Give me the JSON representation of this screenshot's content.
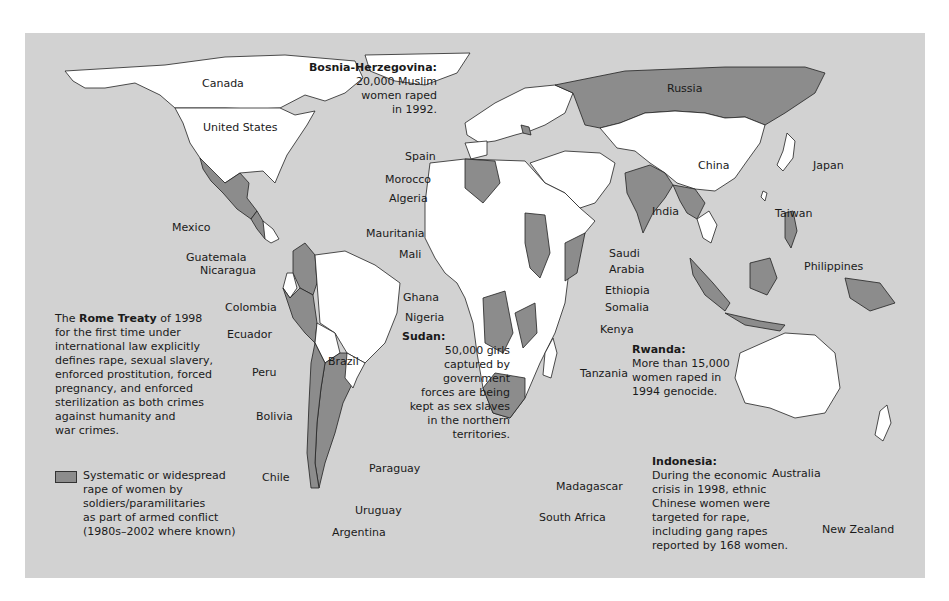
{
  "map": {
    "colors": {
      "ocean": "#d2d2d2",
      "land_default": "#ffffff",
      "land_affected": "#8c8c8c",
      "land_other": "#c9c9c9",
      "border": "#222222"
    },
    "country_labels": [
      {
        "id": "canada",
        "text": "Canada"
      },
      {
        "id": "united-states",
        "text": "United States"
      },
      {
        "id": "mexico",
        "text": "Mexico"
      },
      {
        "id": "guatemala",
        "text": "Guatemala"
      },
      {
        "id": "nicaragua",
        "text": "Nicaragua"
      },
      {
        "id": "colombia",
        "text": "Colombia"
      },
      {
        "id": "ecuador",
        "text": "Ecuador"
      },
      {
        "id": "peru",
        "text": "Peru"
      },
      {
        "id": "brazil",
        "text": "Brazil"
      },
      {
        "id": "bolivia",
        "text": "Bolivia"
      },
      {
        "id": "paraguay",
        "text": "Paraguay"
      },
      {
        "id": "chile",
        "text": "Chile"
      },
      {
        "id": "uruguay",
        "text": "Uruguay"
      },
      {
        "id": "argentina",
        "text": "Argentina"
      },
      {
        "id": "spain",
        "text": "Spain"
      },
      {
        "id": "morocco",
        "text": "Morocco"
      },
      {
        "id": "algeria",
        "text": "Algeria"
      },
      {
        "id": "mauritania",
        "text": "Mauritania"
      },
      {
        "id": "mali",
        "text": "Mali"
      },
      {
        "id": "ghana",
        "text": "Ghana"
      },
      {
        "id": "nigeria",
        "text": "Nigeria"
      },
      {
        "id": "russia",
        "text": "Russia"
      },
      {
        "id": "china",
        "text": "China"
      },
      {
        "id": "japan",
        "text": "Japan"
      },
      {
        "id": "taiwan",
        "text": "Taiwan"
      },
      {
        "id": "india",
        "text": "India"
      },
      {
        "id": "saudi-arabia-1",
        "text": "Saudi"
      },
      {
        "id": "saudi-arabia-2",
        "text": "Arabia"
      },
      {
        "id": "ethiopia",
        "text": "Ethiopia"
      },
      {
        "id": "somalia",
        "text": "Somalia"
      },
      {
        "id": "kenya",
        "text": "Kenya"
      },
      {
        "id": "tanzania",
        "text": "Tanzania"
      },
      {
        "id": "philippines",
        "text": "Philippines"
      },
      {
        "id": "madagascar",
        "text": "Madagascar"
      },
      {
        "id": "south-africa",
        "text": "South Africa"
      },
      {
        "id": "australia",
        "text": "Australia"
      },
      {
        "id": "new-zealand",
        "text": "New Zealand"
      }
    ],
    "annotations": {
      "bosnia": {
        "heading": "Bosnia-Herzegovina:",
        "lines": [
          "20,000 Muslim",
          "women raped",
          "in 1992."
        ]
      },
      "sudan": {
        "heading": "Sudan:",
        "lines": [
          "50,000 girls",
          "captured by",
          "government",
          "forces are being",
          "kept as sex slaves",
          "in the northern",
          "territories."
        ]
      },
      "rwanda": {
        "heading": "Rwanda:",
        "lines": [
          "More than 15,000",
          "women raped in",
          "1994 genocide."
        ]
      },
      "indonesia": {
        "heading": "Indonesia:",
        "lines": [
          "During the economic",
          "crisis in 1998, ethnic",
          "Chinese women were",
          "targeted for rape,",
          "including gang rapes",
          "reported by 168 women."
        ]
      }
    },
    "treaty_note": {
      "pre": "The ",
      "bold": "Rome Treaty",
      "post": " of 1998",
      "lines": [
        "for the first time under",
        "international law explicitly",
        "defines rape, sexual slavery,",
        "enforced prostitution, forced",
        "pregnancy, and enforced",
        "sterilization as both crimes",
        "against humanity and",
        "war crimes."
      ]
    },
    "legend": {
      "swatch_color": "#8c8c8c",
      "lines": [
        "Systematic or widespread",
        "rape of women by",
        "soldiers/paramilitaries",
        "as part of armed conflict",
        "(1980s–2002 where known)"
      ]
    }
  }
}
